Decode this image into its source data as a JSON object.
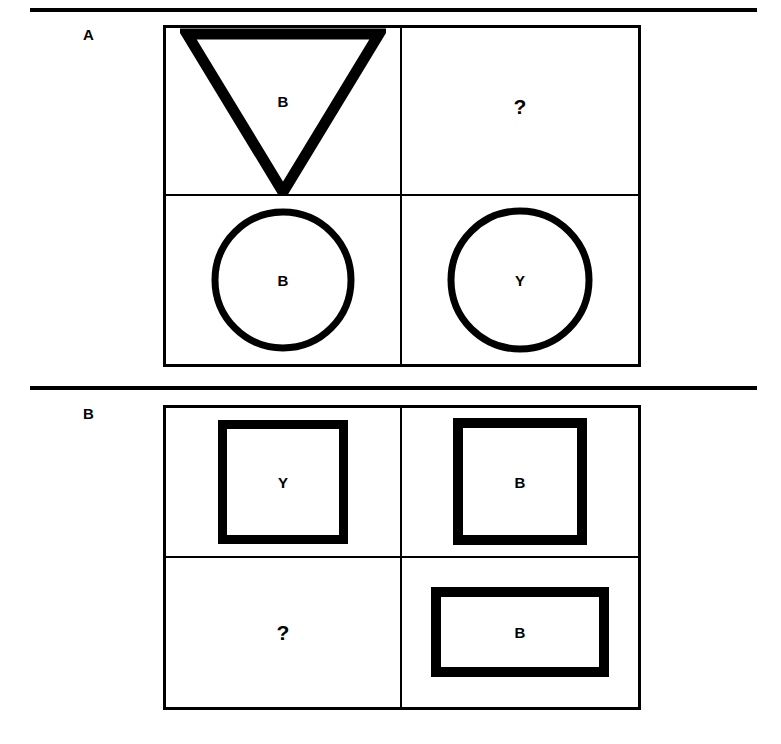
{
  "colors": {
    "ink": "#000000",
    "paper": "#ffffff"
  },
  "rules": {
    "top": "horizontal-rule",
    "middle": "horizontal-rule"
  },
  "panels": [
    {
      "id": "A",
      "label": "A",
      "cells": [
        {
          "position": "top-left",
          "shape": "triangle-down",
          "letter": "B"
        },
        {
          "position": "top-right",
          "shape": "none",
          "letter": "?"
        },
        {
          "position": "bottom-left",
          "shape": "circle",
          "letter": "B"
        },
        {
          "position": "bottom-right",
          "shape": "circle",
          "letter": "Y"
        }
      ]
    },
    {
      "id": "B",
      "label": "B",
      "cells": [
        {
          "position": "top-left",
          "shape": "square",
          "letter": "Y"
        },
        {
          "position": "top-right",
          "shape": "square",
          "letter": "B"
        },
        {
          "position": "bottom-left",
          "shape": "none",
          "letter": "?"
        },
        {
          "position": "bottom-right",
          "shape": "rectangle-wide",
          "letter": "B"
        }
      ]
    }
  ]
}
